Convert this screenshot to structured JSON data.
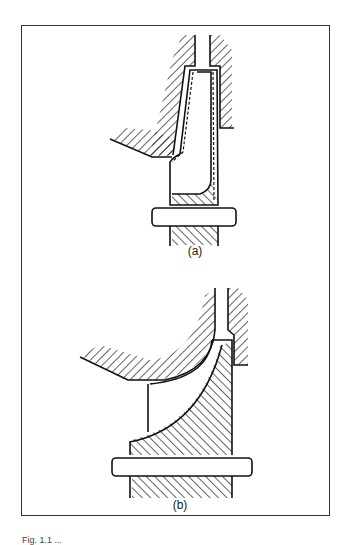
{
  "figure": {
    "panels": [
      {
        "id": "a",
        "label": "(a)",
        "description": "Radial impeller with shroud in casing, narrow vaneless diffuser, shaft below"
      },
      {
        "id": "b",
        "label": "(b)",
        "description": "Mixed-flow impeller with curved hub and shroud in casing, shaft below"
      }
    ],
    "caption": "Fig. 1.1 ..."
  }
}
